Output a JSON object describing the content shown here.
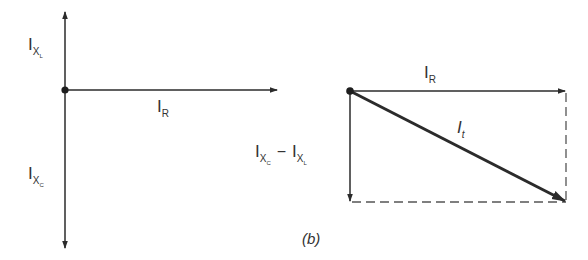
{
  "figure": {
    "caption": "(b)",
    "colors": {
      "line": "#2b2b2b",
      "dashed": "#555555",
      "background": "#ffffff"
    }
  },
  "left_diagram": {
    "origin": [
      65,
      90
    ],
    "labels": {
      "i_xl": {
        "main": "I",
        "sub": "X",
        "subsub": "L"
      },
      "i_xc": {
        "main": "I",
        "sub": "X",
        "subsub": "C"
      },
      "i_r": {
        "main": "I",
        "sub": "R"
      }
    },
    "arrows": [
      {
        "name": "I_XL",
        "from": [
          65,
          90
        ],
        "to": [
          65,
          12
        ],
        "direction": "up"
      },
      {
        "name": "I_XC",
        "from": [
          65,
          90
        ],
        "to": [
          65,
          248
        ],
        "direction": "down"
      },
      {
        "name": "I_R",
        "from": [
          65,
          90
        ],
        "to": [
          277,
          90
        ],
        "direction": "right"
      }
    ]
  },
  "right_diagram": {
    "origin": [
      350,
      91
    ],
    "labels": {
      "i_r": {
        "main": "I",
        "sub": "R"
      },
      "i_t": {
        "main": "I",
        "sub": "t"
      },
      "i_xc_minus_i_xl": {
        "left": {
          "main": "I",
          "sub": "X",
          "subsub": "C"
        },
        "operator": "−",
        "right": {
          "main": "I",
          "sub": "X",
          "subsub": "L"
        }
      }
    },
    "arrows": [
      {
        "name": "I_R",
        "from": [
          350,
          91
        ],
        "to": [
          566,
          91
        ],
        "direction": "right"
      },
      {
        "name": "I_XC - I_XL",
        "from": [
          350,
          91
        ],
        "to": [
          350,
          202
        ],
        "direction": "down"
      },
      {
        "name": "I_t",
        "from": [
          350,
          91
        ],
        "to": [
          566,
          202
        ],
        "direction": "diagonal",
        "bold": true
      }
    ],
    "dashed_lines": [
      {
        "from": [
          350,
          202
        ],
        "to": [
          566,
          202
        ]
      },
      {
        "from": [
          566,
          91
        ],
        "to": [
          566,
          202
        ]
      }
    ]
  }
}
